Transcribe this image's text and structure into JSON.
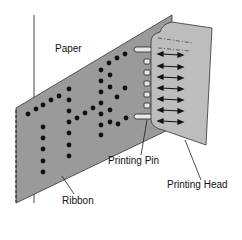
{
  "diagram": {
    "labels": {
      "paper": "Paper",
      "printing_pin": "Printing Pin",
      "printing_head": "Printing Head",
      "ribbon": "Ribbon"
    },
    "colors": {
      "ribbon": "#9a9a9a",
      "head": "#bdbdbd",
      "dot": "#111111",
      "line": "#222222"
    },
    "pin_count": 7
  }
}
